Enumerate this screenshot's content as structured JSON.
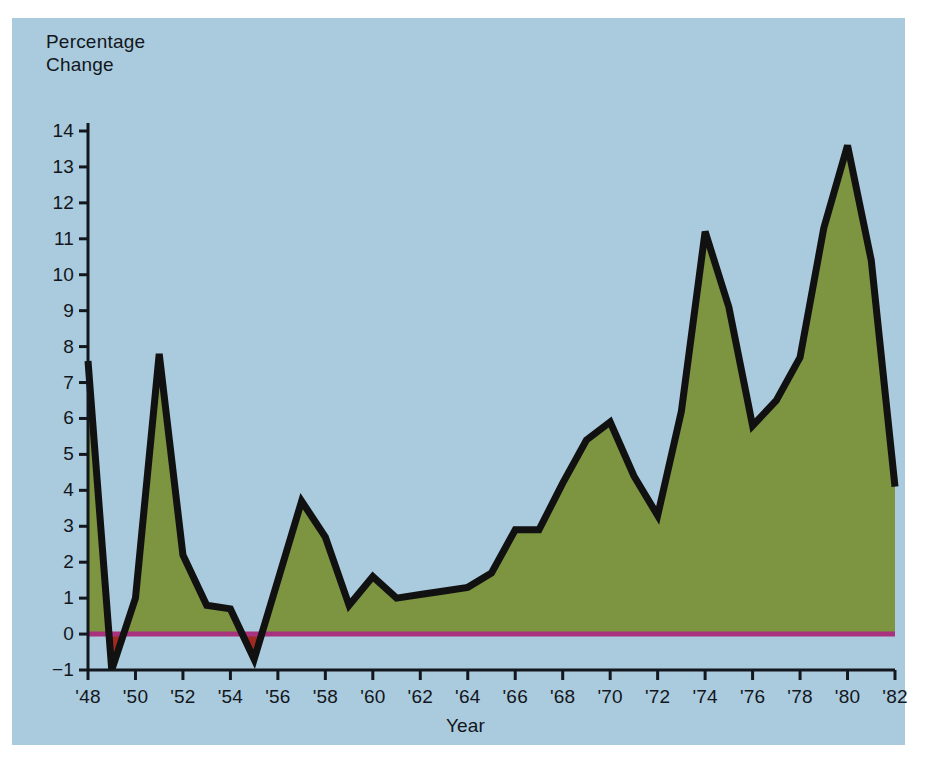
{
  "figure": {
    "background_color": "#ffffff",
    "panel_color": "#a9cbdd",
    "fill_color": "#7d9440",
    "line_color": "#111111",
    "zero_line_color": "#a8327d",
    "negative_fill_color": "#a02a22",
    "axis_color": "#13161c"
  },
  "chart_data": {
    "type": "area",
    "title": "",
    "ylabel": "Percentage\nChange",
    "ylabel_line1": "Percentage",
    "ylabel_line2": "Change",
    "xlabel": "Year",
    "ylim": [
      -1,
      14
    ],
    "xlim": [
      1948,
      1982
    ],
    "grid": false,
    "legend": null,
    "y_ticks": [
      -1,
      0,
      1,
      2,
      3,
      4,
      5,
      6,
      7,
      8,
      9,
      10,
      11,
      12,
      13,
      14
    ],
    "y_tick_labels": [
      "−1",
      "0",
      "1",
      "2",
      "3",
      "4",
      "5",
      "6",
      "7",
      "8",
      "9",
      "10",
      "11",
      "12",
      "13",
      "14"
    ],
    "x_ticks": [
      1948,
      1950,
      1952,
      1954,
      1956,
      1958,
      1960,
      1962,
      1964,
      1966,
      1968,
      1970,
      1972,
      1974,
      1976,
      1978,
      1980,
      1982
    ],
    "x_tick_labels": [
      "'48",
      "'50",
      "'52",
      "'54",
      "'56",
      "'58",
      "'60",
      "'62",
      "'64",
      "'66",
      "'68",
      "'70",
      "'72",
      "'74",
      "'76",
      "'78",
      "'80",
      "'82"
    ],
    "x": [
      1948,
      1949,
      1950,
      1951,
      1952,
      1953,
      1954,
      1955,
      1956,
      1957,
      1958,
      1959,
      1960,
      1961,
      1962,
      1963,
      1964,
      1965,
      1966,
      1967,
      1968,
      1969,
      1970,
      1971,
      1972,
      1973,
      1974,
      1975,
      1976,
      1977,
      1978,
      1979,
      1980,
      1981,
      1982
    ],
    "values": [
      7.6,
      -1.0,
      1.0,
      7.8,
      2.2,
      0.8,
      0.7,
      -0.7,
      1.5,
      3.7,
      2.7,
      0.8,
      1.6,
      1.0,
      1.1,
      1.2,
      1.3,
      1.7,
      2.9,
      2.9,
      4.2,
      5.4,
      5.9,
      4.4,
      3.3,
      6.2,
      11.2,
      9.1,
      5.8,
      6.5,
      7.7,
      11.3,
      13.6,
      10.4,
      4.1
    ]
  },
  "axes": {
    "y_title_line1": "Percentage",
    "y_title_line2": "Change",
    "x_title": "Year"
  }
}
